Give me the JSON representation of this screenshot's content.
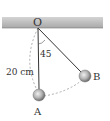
{
  "diagram": {
    "type": "pendulum",
    "pivot_label": "O",
    "angle_label": "45",
    "length_label": "20 cm",
    "ball_a_label": "A",
    "ball_b_label": "B",
    "colors": {
      "ceiling": "#b8b8b8",
      "string": "#333333",
      "ball": "#a0a0a0",
      "dashed_arc": "#999999"
    }
  }
}
